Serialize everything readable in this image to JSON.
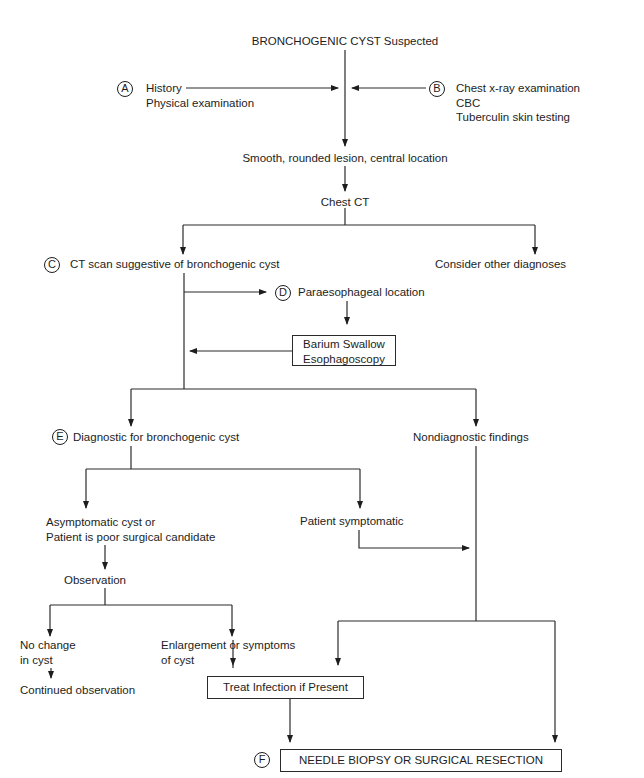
{
  "title": "BRONCHOGENIC CYST Suspected",
  "step_a": {
    "marker": "A",
    "lines": [
      "History",
      "Physical examination"
    ]
  },
  "step_b": {
    "marker": "B",
    "lines": [
      "Chest x-ray examination",
      "CBC",
      "Tuberculin skin testing"
    ]
  },
  "lesion": "Smooth, rounded lesion, central location",
  "chest_ct": "Chest CT",
  "step_c": {
    "marker": "C",
    "text": "CT scan suggestive of bronchogenic cyst"
  },
  "other_diagnoses": "Consider other diagnoses",
  "step_d": {
    "marker": "D",
    "text": "Paraesophageal location"
  },
  "barium_box": {
    "lines": [
      "Barium Swallow",
      "Esophagoscopy"
    ]
  },
  "step_e": {
    "marker": "E",
    "text": "Diagnostic for bronchogenic cyst"
  },
  "nondiagnostic": "Nondiagnostic findings",
  "asymptomatic": {
    "lines": [
      "Asymptomatic cyst or",
      "Patient is poor surgical candidate"
    ]
  },
  "symptomatic": "Patient symptomatic",
  "observation": "Observation",
  "no_change": {
    "lines": [
      "No change",
      "in cyst"
    ]
  },
  "enlargement": {
    "lines": [
      "Enlargement or symptoms",
      "of cyst"
    ]
  },
  "continued": "Continued observation",
  "treat_box": "Treat Infection if Present",
  "step_f": {
    "marker": "F",
    "text": "NEEDLE BIOPSY OR SURGICAL RESECTION"
  }
}
